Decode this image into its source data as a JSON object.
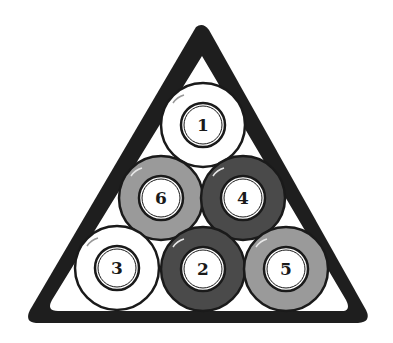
{
  "rack": {
    "shape": "triangle",
    "color": "#1e1e1e",
    "inner_color": "#ffffff"
  },
  "colors": {
    "white": "#ffffff",
    "light_gray": "#9a9a9a",
    "dark_gray": "#4a4a4a",
    "outline": "#1a1a1a"
  },
  "balls": [
    {
      "number": "1",
      "row": 1,
      "shade": "white",
      "cx": 203,
      "cy": 125
    },
    {
      "number": "6",
      "row": 2,
      "shade": "light_gray",
      "cx": 161,
      "cy": 198
    },
    {
      "number": "4",
      "row": 2,
      "shade": "dark_gray",
      "cx": 243,
      "cy": 198
    },
    {
      "number": "3",
      "row": 3,
      "shade": "white",
      "cx": 117,
      "cy": 268
    },
    {
      "number": "2",
      "row": 3,
      "shade": "dark_gray",
      "cx": 203,
      "cy": 269
    },
    {
      "number": "5",
      "row": 3,
      "shade": "light_gray",
      "cx": 286,
      "cy": 269
    }
  ]
}
